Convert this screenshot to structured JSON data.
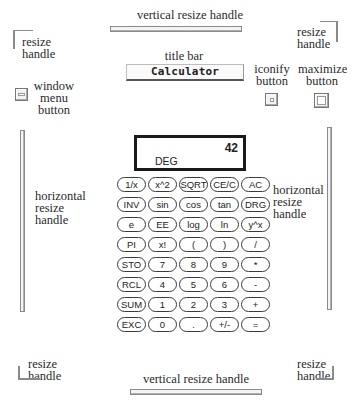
{
  "diagram": {
    "labels": {
      "top_vertical_resize": "vertical resize handle",
      "bottom_vertical_resize": "vertical resize handle",
      "top_left_resize": [
        "resize",
        "handle"
      ],
      "top_right_resize": [
        "resize",
        "handle"
      ],
      "bottom_left_resize": [
        "resize",
        "handle"
      ],
      "bottom_right_resize": [
        "resize",
        "handle"
      ],
      "title_bar": "title bar",
      "window_menu_button": [
        "window",
        "menu",
        "button"
      ],
      "iconify_button": [
        "iconify",
        "button"
      ],
      "maximize_button": [
        "maximize",
        "button"
      ],
      "left_horizontal_resize": [
        "horizontal",
        "resize",
        "handle"
      ],
      "right_horizontal_resize": [
        "horizontal",
        "resize",
        "handle"
      ]
    }
  },
  "window": {
    "title": "Calculator"
  },
  "calculator": {
    "display": {
      "value": "42",
      "mode": "DEG"
    },
    "keys": [
      [
        "1/x",
        "x^2",
        "SQRT",
        "CE/C",
        "AC"
      ],
      [
        "INV",
        "sin",
        "cos",
        "tan",
        "DRG"
      ],
      [
        "e",
        "EE",
        "log",
        "ln",
        "y^x"
      ],
      [
        "PI",
        "x!",
        "(",
        ")",
        "/"
      ],
      [
        "STO",
        "7",
        "8",
        "9",
        "*"
      ],
      [
        "RCL",
        "4",
        "5",
        "6",
        "-"
      ],
      [
        "SUM",
        "1",
        "2",
        "3",
        "+"
      ],
      [
        "EXC",
        "0",
        ".",
        "+/-",
        "="
      ]
    ]
  }
}
